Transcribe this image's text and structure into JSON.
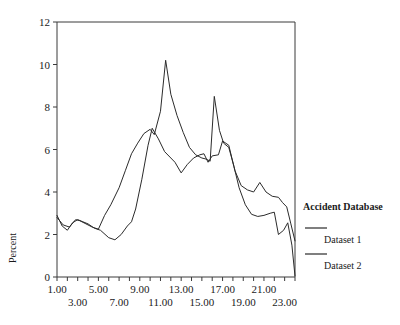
{
  "chart_data": {
    "type": "line",
    "title": "",
    "xlabel": "",
    "ylabel": "Percent",
    "xlim": [
      1,
      24
    ],
    "ylim": [
      0,
      12
    ],
    "grid": false,
    "legend_position": "right",
    "legend_title": "Accident Database",
    "x": [
      1,
      2,
      3,
      4,
      5,
      6,
      7,
      8,
      9,
      10,
      11,
      12,
      13,
      14,
      15,
      16,
      17,
      18,
      19,
      20,
      21,
      22,
      23,
      24
    ],
    "xtick_labels_row1": [
      "1.00",
      "5.00",
      "9.00",
      "13.00",
      "17.00",
      "21.00"
    ],
    "xtick_labels_row2": [
      "3.00",
      "7.00",
      "11.00",
      "15.00",
      "19.00",
      "23.00"
    ],
    "xticks_row1": [
      1,
      5,
      9,
      13,
      17,
      21
    ],
    "xticks_row2": [
      3,
      7,
      11,
      15,
      19,
      23
    ],
    "ytick_labels": [
      "0",
      "2",
      "4",
      "6",
      "8",
      "10",
      "12"
    ],
    "yticks": [
      0,
      2,
      4,
      6,
      8,
      10,
      12
    ],
    "series": [
      {
        "name": "Dataset 1",
        "color": "#2b2b2b",
        "values": [
          2.9,
          2.2,
          2.7,
          2.5,
          2.2,
          1.9,
          1.7,
          2.1,
          2.6,
          2.8,
          4.4,
          6.2,
          7.0,
          6.4,
          5.8,
          5.6,
          5.7,
          5.5,
          5.8,
          5.7,
          5.7,
          6.4,
          6.2,
          5.8
        ]
      },
      {
        "name": "Dataset 2",
        "color": "#2b2b2b",
        "values": [
          2.8,
          2.4,
          2.7,
          2.4,
          2.3,
          2.8,
          3.4,
          4.4,
          5.6,
          6.6,
          7.0,
          8.7,
          10.2,
          8.1,
          6.5,
          5.5,
          4.9,
          5.3,
          5.6,
          5.8,
          5.4,
          8.5,
          6.1,
          6.3
        ]
      }
    ],
    "series_points": {
      "dataset1": [
        [
          1,
          2.9
        ],
        [
          1.5,
          2.4
        ],
        [
          2,
          2.2
        ],
        [
          2.5,
          2.55
        ],
        [
          3,
          2.7
        ],
        [
          3.5,
          2.6
        ],
        [
          4,
          2.5
        ],
        [
          4.6,
          2.3
        ],
        [
          5.2,
          2.2
        ],
        [
          6,
          1.85
        ],
        [
          6.6,
          1.75
        ],
        [
          7.2,
          2.0
        ],
        [
          7.8,
          2.4
        ],
        [
          8.2,
          2.6
        ],
        [
          8.6,
          3.2
        ],
        [
          9.2,
          4.6
        ],
        [
          9.8,
          6.2
        ],
        [
          10.2,
          7.0
        ],
        [
          10.8,
          6.5
        ],
        [
          11.4,
          5.9
        ],
        [
          12,
          5.6
        ],
        [
          12.4,
          5.4
        ],
        [
          13,
          4.9
        ],
        [
          13.6,
          5.3
        ],
        [
          14.2,
          5.6
        ],
        [
          14.8,
          5.75
        ],
        [
          15.2,
          5.8
        ],
        [
          15.6,
          5.4
        ],
        [
          16,
          5.7
        ],
        [
          16.6,
          5.75
        ],
        [
          17,
          6.4
        ],
        [
          17.6,
          6.2
        ],
        [
          18.2,
          5.0
        ],
        [
          18.8,
          4.3
        ],
        [
          19.4,
          4.1
        ],
        [
          20,
          4.0
        ],
        [
          20.6,
          4.45
        ],
        [
          21.2,
          4.0
        ],
        [
          21.8,
          3.8
        ],
        [
          22.4,
          3.75
        ],
        [
          22.8,
          3.5
        ],
        [
          23.2,
          3.3
        ],
        [
          23.6,
          2.5
        ],
        [
          24,
          1.7
        ]
      ],
      "dataset2": [
        [
          1,
          2.8
        ],
        [
          1.6,
          2.45
        ],
        [
          2.2,
          2.35
        ],
        [
          2.8,
          2.7
        ],
        [
          3.2,
          2.65
        ],
        [
          3.8,
          2.5
        ],
        [
          4.4,
          2.35
        ],
        [
          5,
          2.25
        ],
        [
          5.6,
          2.9
        ],
        [
          6.2,
          3.4
        ],
        [
          7,
          4.2
        ],
        [
          7.6,
          5.0
        ],
        [
          8.2,
          5.8
        ],
        [
          8.8,
          6.3
        ],
        [
          9.4,
          6.75
        ],
        [
          10,
          6.95
        ],
        [
          10.4,
          6.7
        ],
        [
          11,
          7.8
        ],
        [
          11.5,
          10.2
        ],
        [
          12,
          8.6
        ],
        [
          12.6,
          7.6
        ],
        [
          13.2,
          6.8
        ],
        [
          13.8,
          6.1
        ],
        [
          14.4,
          5.75
        ],
        [
          15,
          5.6
        ],
        [
          15.4,
          5.55
        ],
        [
          15.8,
          5.45
        ],
        [
          16.2,
          8.5
        ],
        [
          16.7,
          6.9
        ],
        [
          17.1,
          6.3
        ],
        [
          17.6,
          6.1
        ],
        [
          18.1,
          5.2
        ],
        [
          18.6,
          4.2
        ],
        [
          19.2,
          3.4
        ],
        [
          19.8,
          2.95
        ],
        [
          20.4,
          2.85
        ],
        [
          21,
          2.9
        ],
        [
          21.6,
          3.0
        ],
        [
          22,
          3.05
        ],
        [
          22.4,
          2.0
        ],
        [
          22.9,
          2.2
        ],
        [
          23.3,
          2.55
        ],
        [
          23.7,
          1.5
        ],
        [
          24,
          0.05
        ]
      ]
    }
  },
  "axes": {
    "y_axis_title": "Percent"
  },
  "legend": {
    "title": "Accident Database",
    "entries": [
      {
        "label": "Dataset 1"
      },
      {
        "label": "Dataset 2"
      }
    ]
  }
}
